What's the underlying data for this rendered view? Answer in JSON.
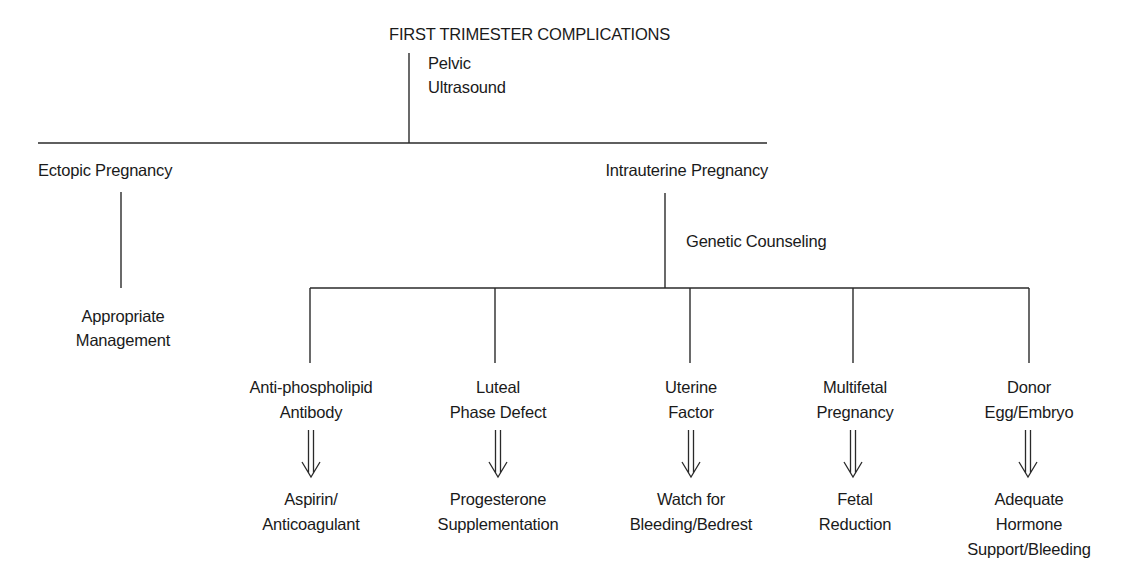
{
  "diagram": {
    "title": "FIRST TRIMESTER COMPLICATIONS",
    "root_edge_label": [
      "Pelvic",
      "Ultrasound"
    ],
    "branches": {
      "ectopic": {
        "label": "Ectopic Pregnancy",
        "outcome": [
          "Appropriate",
          "Management"
        ]
      },
      "intrauterine": {
        "label": "Intrauterine Pregnancy",
        "edge_label": "Genetic Counseling",
        "children": [
          {
            "cause": [
              "Anti-phospholipid",
              "Antibody"
            ],
            "treatment": [
              "Aspirin/",
              "Anticoagulant"
            ]
          },
          {
            "cause": [
              "Luteal",
              "Phase Defect"
            ],
            "treatment": [
              "Progesterone",
              "Supplementation"
            ]
          },
          {
            "cause": [
              "Uterine",
              "Factor"
            ],
            "treatment": [
              "Watch for",
              "Bleeding/Bedrest"
            ]
          },
          {
            "cause": [
              "Multifetal",
              "Pregnancy"
            ],
            "treatment": [
              "Fetal",
              "Reduction"
            ]
          },
          {
            "cause": [
              "Donor",
              "Egg/Embryo"
            ],
            "treatment": [
              "Adequate",
              "Hormone",
              "Support/Bleeding"
            ]
          }
        ]
      }
    },
    "arrow_icon": "double-down-arrow",
    "line_color": "#2a2a2a",
    "text_color": "#1a1a1a"
  }
}
